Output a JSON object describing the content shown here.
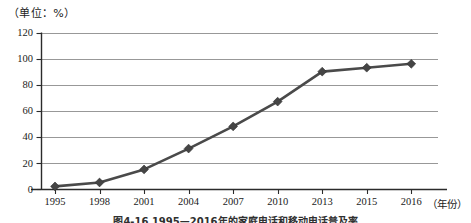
{
  "unit_label": "（单位：%）",
  "x_axis_title": "（年份）",
  "figure_caption": "图4-16  1995—2016年的家庭电话和移动电话普及率",
  "axis": {
    "y_ticks": [
      "0",
      "20",
      "40",
      "60",
      "80",
      "100",
      "120"
    ],
    "x_ticks": [
      "1995",
      "1998",
      "2001",
      "2004",
      "2007",
      "2010",
      "2013",
      "2015",
      "2016"
    ]
  },
  "colors": {
    "line": "#4a4a4a",
    "marker": "#454545",
    "grid": "#8d8d8d",
    "axis": "#2b2b2b",
    "background": "#ffffff"
  },
  "chart_data": {
    "type": "line",
    "title": "",
    "subtitle": "",
    "xlabel": "（年份）",
    "ylabel": "（单位：%）",
    "categories": [
      "1995",
      "1998",
      "2001",
      "2004",
      "2007",
      "2010",
      "2013",
      "2015",
      "2016"
    ],
    "series": [
      {
        "name": "普及率",
        "values": [
          2,
          5,
          15,
          31,
          48,
          67,
          90,
          93,
          96
        ]
      }
    ],
    "ylim": [
      0,
      120
    ],
    "y_ticks": [
      0,
      20,
      40,
      60,
      80,
      100,
      120
    ],
    "grid": true,
    "grid_axis": "y",
    "legend": false,
    "legend_position": "none",
    "marker": "diamond",
    "annotations": []
  }
}
